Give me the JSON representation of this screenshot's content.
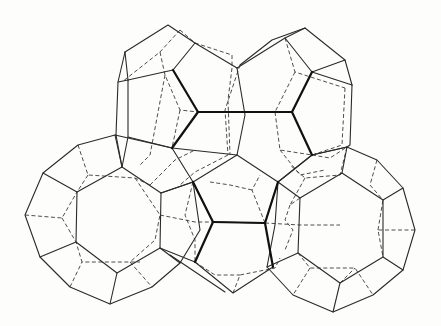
{
  "figure": {
    "background": "#fdfdfc",
    "line_color": "#2a2a2a",
    "polyhedra": [
      {
        "name": "top-left-dodecahedron",
        "type": "pentagonal dodecahedron"
      },
      {
        "name": "top-right-dodecahedron",
        "type": "pentagonal dodecahedron"
      },
      {
        "name": "left-tetrakaidecahedron",
        "type": "tetrakaidecahedron"
      },
      {
        "name": "right-tetrakaidecahedron",
        "type": "tetrakaidecahedron"
      }
    ]
  }
}
